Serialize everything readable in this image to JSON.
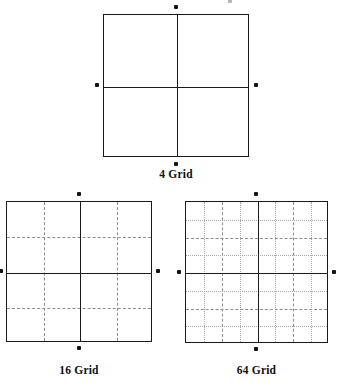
{
  "figure": {
    "background_color": "#ffffff",
    "line_color_solid": "#1a1a1a",
    "line_color_dashed": "#8d8d8d",
    "line_color_dotted": "#a9a9a9",
    "dot_color": "#141414"
  },
  "panels": [
    {
      "id": "grid-4",
      "caption": "4 Grid",
      "cells": 4,
      "divisions": 2,
      "box": {
        "x": 103,
        "y": 14,
        "w": 146,
        "h": 143
      },
      "caption_pos": {
        "x": 103,
        "y": 168,
        "w": 146
      },
      "solid_fractions": [
        0.5
      ],
      "dashed_fractions": [],
      "dotted_fractions": [],
      "edge_dots": [
        {
          "edge": "top",
          "x": 176,
          "y": 7
        },
        {
          "edge": "bottom",
          "x": 176,
          "y": 164
        },
        {
          "edge": "left",
          "x": 97,
          "y": 85
        },
        {
          "edge": "right",
          "x": 256,
          "y": 85
        }
      ]
    },
    {
      "id": "grid-16",
      "caption": "16 Grid",
      "cells": 16,
      "divisions": 4,
      "box": {
        "x": 6,
        "y": 201,
        "w": 146,
        "h": 141
      },
      "caption_pos": {
        "x": 6,
        "y": 364,
        "w": 146
      },
      "solid_fractions": [
        0.5
      ],
      "dashed_fractions": [
        0.25,
        0.75
      ],
      "dotted_fractions": [],
      "edge_dots": [
        {
          "edge": "top",
          "x": 79,
          "y": 194
        },
        {
          "edge": "bottom",
          "x": 79,
          "y": 348
        },
        {
          "edge": "left",
          "x": 1,
          "y": 271
        },
        {
          "edge": "right",
          "x": 158,
          "y": 271
        }
      ]
    },
    {
      "id": "grid-64",
      "caption": "64 Grid",
      "cells": 64,
      "divisions": 8,
      "box": {
        "x": 185,
        "y": 201,
        "w": 143,
        "h": 142
      },
      "caption_pos": {
        "x": 185,
        "y": 364,
        "w": 143
      },
      "solid_fractions": [
        0.5
      ],
      "dashed_fractions": [
        0.25,
        0.75
      ],
      "dotted_fractions": [
        0.125,
        0.375,
        0.625,
        0.875
      ],
      "edge_dots": [
        {
          "edge": "top",
          "x": 256,
          "y": 194
        },
        {
          "edge": "bottom",
          "x": 256,
          "y": 349
        },
        {
          "edge": "left",
          "x": 179,
          "y": 272
        },
        {
          "edge": "right",
          "x": 334,
          "y": 272
        }
      ]
    }
  ],
  "stray_marks": [
    {
      "id": "clipped-dot-top",
      "x": 230,
      "y": 1,
      "faint": true
    }
  ]
}
